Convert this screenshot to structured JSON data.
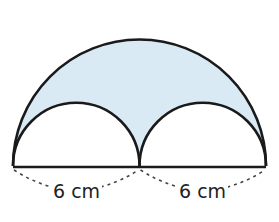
{
  "figure": {
    "shaded_color": "#d9eaf5",
    "stroke_color": "#1a1a1a",
    "labels": {
      "left_diameter": "6 cm",
      "right_diameter": "6 cm"
    }
  }
}
